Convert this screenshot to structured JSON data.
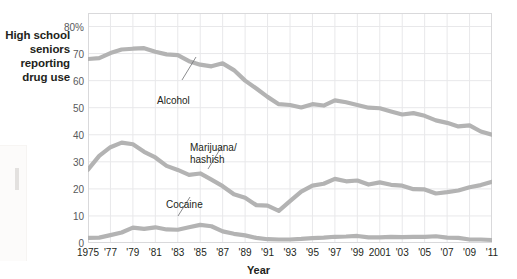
{
  "captions": {
    "y_axis": "High school\nseniors\nreporting\ndrug use",
    "x_axis": "Year"
  },
  "colors": {
    "series_line": "#b3b3b3",
    "grid": "#e8e8ea",
    "plot_border": "#d9d9db",
    "tick_text": "#58595b",
    "caption_text": "#231f20",
    "leader_line": "#6d6e71"
  },
  "chart_data": {
    "type": "line",
    "title": "",
    "xlabel": "Year",
    "ylabel": "High school seniors reporting drug use",
    "xlim": [
      1975,
      2011
    ],
    "ylim": [
      0,
      85
    ],
    "yticks": [
      0,
      10,
      20,
      30,
      40,
      50,
      60,
      70,
      80
    ],
    "ytick_labels": [
      "0",
      "10",
      "20",
      "30",
      "40",
      "50",
      "60",
      "70",
      "80%"
    ],
    "xticks": [
      1975,
      1977,
      1979,
      1981,
      1983,
      1985,
      1987,
      1989,
      1991,
      1993,
      1995,
      1997,
      1999,
      2001,
      2003,
      2005,
      2007,
      2009,
      2011
    ],
    "xtick_labels": [
      "1975",
      "'77",
      "'79",
      "'81",
      "'83",
      "'85",
      "'87",
      "'89",
      "'91",
      "'93",
      "'95",
      "'97",
      "'99",
      "2001",
      "'03",
      "'05",
      "'07",
      "'09",
      "'11"
    ],
    "grid": true,
    "legend": "inline-annotations",
    "x": [
      1975,
      1976,
      1977,
      1978,
      1979,
      1980,
      1981,
      1982,
      1983,
      1984,
      1985,
      1986,
      1987,
      1988,
      1989,
      1990,
      1991,
      1992,
      1993,
      1994,
      1995,
      1996,
      1997,
      1998,
      1999,
      2000,
      2001,
      2002,
      2003,
      2004,
      2005,
      2006,
      2007,
      2008,
      2009,
      2010,
      2011
    ],
    "series": [
      {
        "name": "Alcohol",
        "values": [
          68,
          68.3,
          70.2,
          71.5,
          71.8,
          72.0,
          70.7,
          69.7,
          69.4,
          67.2,
          65.9,
          65.3,
          66.4,
          63.9,
          60.0,
          57.1,
          54.0,
          51.3,
          51.0,
          50.1,
          51.3,
          50.8,
          52.7,
          52.0,
          51.0,
          50.0,
          49.8,
          48.6,
          47.5,
          48.0,
          47.0,
          45.3,
          44.4,
          43.1,
          43.5,
          41.2,
          40.0
        ]
      },
      {
        "name": "Marijuana/\nhashish",
        "values": [
          27.1,
          32.2,
          35.4,
          37.1,
          36.5,
          33.7,
          31.6,
          28.5,
          27.0,
          25.2,
          25.7,
          23.4,
          21.0,
          18.0,
          16.7,
          14.0,
          13.8,
          11.9,
          15.5,
          19.0,
          21.2,
          21.9,
          23.7,
          22.8,
          23.1,
          21.6,
          22.4,
          21.5,
          21.2,
          19.9,
          19.8,
          18.3,
          18.8,
          19.4,
          20.6,
          21.4,
          22.6
        ]
      },
      {
        "name": "Cocaine",
        "values": [
          1.9,
          2.0,
          2.9,
          3.9,
          5.7,
          5.2,
          5.8,
          5.0,
          4.9,
          5.8,
          6.7,
          6.2,
          4.3,
          3.4,
          2.8,
          1.9,
          1.4,
          1.3,
          1.3,
          1.5,
          1.8,
          2.0,
          2.3,
          2.4,
          2.6,
          2.1,
          2.1,
          2.3,
          2.2,
          2.3,
          2.3,
          2.5,
          2.0,
          1.9,
          1.3,
          1.3,
          1.1
        ]
      }
    ]
  },
  "annotations": [
    {
      "name": "alcohol",
      "text": "Alcohol"
    },
    {
      "name": "marijuana",
      "text": "Marijuana/\nhashish"
    },
    {
      "name": "cocaine",
      "text": "Cocaine"
    }
  ]
}
